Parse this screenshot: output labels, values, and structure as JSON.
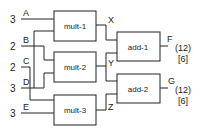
{
  "diagram": {
    "inputs": [
      {
        "name": "A",
        "width": "3"
      },
      {
        "name": "B",
        "width": "2"
      },
      {
        "name": "C",
        "width": "2"
      },
      {
        "name": "D",
        "width": "3"
      },
      {
        "name": "E",
        "width": "3"
      }
    ],
    "blocks": [
      {
        "id": "mult1",
        "label": "mult-1"
      },
      {
        "id": "mult2",
        "label": "mult-2"
      },
      {
        "id": "mult3",
        "label": "mult-3"
      },
      {
        "id": "add1",
        "label": "add-1"
      },
      {
        "id": "add2",
        "label": "add-2"
      }
    ],
    "intermediates": [
      {
        "name": "X"
      },
      {
        "name": "Y"
      },
      {
        "name": "Z"
      }
    ],
    "outputs": [
      {
        "name": "F",
        "annotation1": "(12)",
        "annotation2": "[6]"
      },
      {
        "name": "G",
        "annotation1": "(12)",
        "annotation2": "[6]"
      }
    ],
    "connections": [
      "A -> mult-1",
      "D -> mult-1",
      "B -> mult-2",
      "C -> mult-2",
      "B -> mult-3",
      "E -> mult-3",
      "mult-1 -> X",
      "mult-2 -> Y",
      "mult-3 -> Z",
      "X -> add-1",
      "Y -> add-1",
      "Y -> add-2",
      "Z -> add-2",
      "add-1 -> F",
      "add-2 -> G"
    ]
  }
}
